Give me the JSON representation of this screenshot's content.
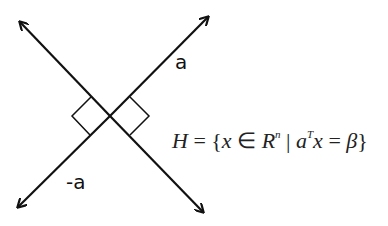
{
  "diagram": {
    "vector_label": "a",
    "negative_vector_label": "-a",
    "formula": {
      "lhs": "H",
      "eq": " = {",
      "var": "x",
      "member": " ∈ ",
      "space": "R",
      "space_exp": "n",
      "bar": " | ",
      "coef": "a",
      "coef_exp": "T",
      "var2": "x",
      "eq2": " = ",
      "rhs": "β",
      "close": "}"
    },
    "stroke_color": "#111111"
  }
}
